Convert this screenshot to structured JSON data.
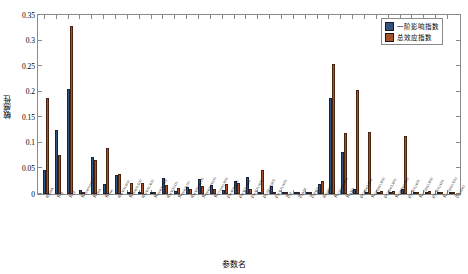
{
  "chart_data": {
    "type": "bar",
    "title": "",
    "xlabel": "参数名",
    "ylabel": "敏感性",
    "ylim": [
      0,
      0.35
    ],
    "yticks": [
      "0",
      "0.05",
      "0.1",
      "0.15",
      "0.2",
      "0.25",
      "0.3",
      "0.35"
    ],
    "ytick_values": [
      0,
      0.05,
      0.1,
      0.15,
      0.2,
      0.25,
      0.3,
      0.35
    ],
    "grid": false,
    "legend_position": "top-right",
    "legend": [
      "一阶影响指数",
      "总效应指数"
    ],
    "colors": {
      "series1": "#32527E",
      "series2": "#A8522A"
    },
    "categories": [
      "φHMA",
      "KA",
      "KFF",
      "KHNO3/NO3-",
      "KHIA",
      "Kmax",
      "φHNO3,SO2",
      "KHNO3,SO2",
      "φHNO3,NO2",
      "KHNO3,NO2",
      "φHNO3,O3",
      "KHNO3,O3",
      "φHNO3,N2O5",
      "KHNO3,N2O5",
      "KC2H4O,NO2",
      "μHNO3,SO2",
      "μHNO3,NO2",
      "μHNO3,NO3",
      "μC2H4O,SO2",
      "μHNO3,N2O",
      "βFF",
      "βHMA",
      "βHNO3",
      "φO2/NO",
      "KC2H4O,NOx",
      "KSTD",
      "μC2H4O,NO2",
      "KC2H4O,NO2",
      "μC2H4O,NO2",
      "KC2H4O,NO2",
      "μHNO3,NO3",
      "KC2H4O,NO2",
      "μHNO3,N2O",
      "KC2H4O,N2O",
      "βC2H4O"
    ],
    "series": [
      {
        "name": "一阶影响指数",
        "values": [
          0.046,
          0.125,
          0.205,
          0.008,
          0.072,
          0.02,
          0.038,
          0.0,
          0.0,
          0.002,
          0.031,
          0.005,
          0.013,
          0.03,
          0.017,
          0.008,
          0.025,
          0.034,
          0.0,
          0.016,
          0.002,
          0.0,
          0.0,
          0.019,
          0.187,
          0.082,
          0.01,
          0.002,
          0.002,
          0.002,
          0.009,
          0.0,
          0.0,
          0.002,
          0.0
        ]
      },
      {
        "name": "总效应指数",
        "values": [
          0.188,
          0.076,
          0.328,
          0.0,
          0.066,
          0.089,
          0.04,
          0.021,
          0.022,
          0.002,
          0.018,
          0.011,
          0.01,
          0.016,
          0.009,
          0.02,
          0.022,
          0.01,
          0.046,
          0.003,
          0.0,
          0.0,
          0.0,
          0.026,
          0.254,
          0.12,
          0.204,
          0.122,
          0.006,
          0.006,
          0.114,
          0.003,
          0.006,
          0.004,
          0.0
        ]
      }
    ]
  }
}
